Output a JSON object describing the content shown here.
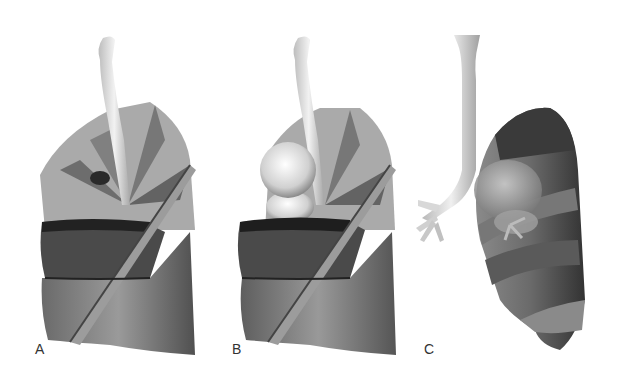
{
  "figure": {
    "panels": [
      {
        "label": "A",
        "content": "3D lung rendering with trachea, translucent lobes and segmental planes"
      },
      {
        "label": "B",
        "content": "3D lung rendering with trachea, translucent lobes and spherical masses"
      },
      {
        "label": "C",
        "content": "3D lung rendering viewed from side with trachea, bronchi and lobes"
      }
    ]
  },
  "colors": {
    "background": "#ffffff",
    "lung_surface": "#7a7a7a",
    "lung_dark": "#3a3a3a",
    "trachea": "#e4e4e4",
    "sphere": "#dcdcdc"
  }
}
